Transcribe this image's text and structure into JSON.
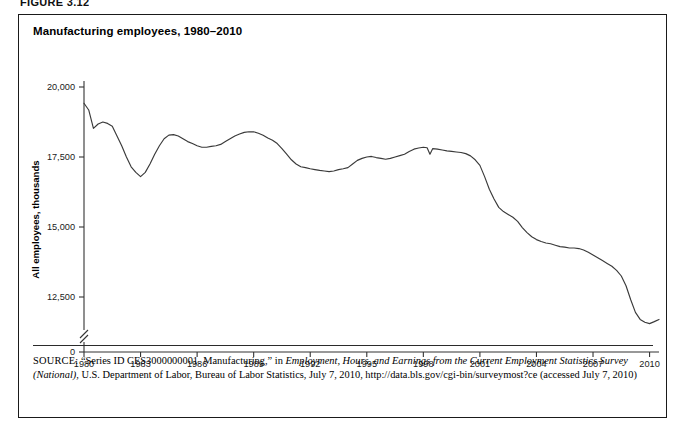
{
  "figure": {
    "number_label": "FIGURE 3.12",
    "title": "Manufacturing employees, 1980–2010"
  },
  "source": {
    "label": "SOURCE:",
    "text_before_italic": " “Series ID CES3000000001. Manufacturing,” in ",
    "italic_text": "Employment, Hours, and Earnings from the Current Employment Statistics Survey (National)",
    "text_after_italic": ", U.S. Department of Labor, Bureau of Labor Statistics, July 7, 2010, http://data.bls.gov/cgi-bin/surveymost?ce (accessed July 7, 2010)"
  },
  "chart_data": {
    "type": "line",
    "title": "Manufacturing employees, 1980–2010",
    "xlabel": "Month",
    "ylabel": "All employees, thousands",
    "xlim": [
      1980,
      2010.5
    ],
    "ylim": [
      11500,
      20000
    ],
    "yaxis_break": true,
    "yaxis_break_note": "axis broken between 0 and 12,500",
    "grid": false,
    "legend": "none",
    "xticks": [
      "1980",
      "1983",
      "1986",
      "1989",
      "1992",
      "1995",
      "1998",
      "2001",
      "2004",
      "2007",
      "2010"
    ],
    "xtick_values": [
      1980,
      1983,
      1986,
      1989,
      1992,
      1995,
      1998,
      2001,
      2004,
      2007,
      2010
    ],
    "yticks": [
      "0",
      "12,500",
      "15,000",
      "17,500",
      "20,000"
    ],
    "ytick_values": [
      0,
      12500,
      15000,
      17500,
      20000
    ],
    "series": [
      {
        "name": "All manufacturing employees (thousands)",
        "x": [
          1980.0,
          1980.25,
          1980.5,
          1980.75,
          1981.0,
          1981.25,
          1981.5,
          1981.75,
          1982.0,
          1982.25,
          1982.5,
          1982.75,
          1983.0,
          1983.25,
          1983.5,
          1983.75,
          1984.0,
          1984.25,
          1984.5,
          1984.75,
          1985.0,
          1985.25,
          1985.5,
          1985.75,
          1986.0,
          1986.25,
          1986.5,
          1986.75,
          1987.0,
          1987.25,
          1987.5,
          1987.75,
          1988.0,
          1988.25,
          1988.5,
          1988.75,
          1989.0,
          1989.25,
          1989.5,
          1989.75,
          1990.0,
          1990.25,
          1990.5,
          1990.75,
          1991.0,
          1991.25,
          1991.5,
          1991.75,
          1992.0,
          1992.25,
          1992.5,
          1992.75,
          1993.0,
          1993.25,
          1993.5,
          1993.75,
          1994.0,
          1994.25,
          1994.5,
          1994.75,
          1995.0,
          1995.25,
          1995.5,
          1995.75,
          1996.0,
          1996.25,
          1996.5,
          1996.75,
          1997.0,
          1997.25,
          1997.5,
          1997.75,
          1998.0,
          1998.2,
          1998.35,
          1998.5,
          1998.75,
          1999.0,
          1999.25,
          1999.5,
          1999.75,
          2000.0,
          2000.25,
          2000.5,
          2000.75,
          2001.0,
          2001.25,
          2001.5,
          2001.75,
          2002.0,
          2002.25,
          2002.5,
          2002.75,
          2003.0,
          2003.25,
          2003.5,
          2003.75,
          2004.0,
          2004.25,
          2004.5,
          2004.75,
          2005.0,
          2005.25,
          2005.5,
          2005.75,
          2006.0,
          2006.25,
          2006.5,
          2006.75,
          2007.0,
          2007.25,
          2007.5,
          2007.75,
          2008.0,
          2008.25,
          2008.5,
          2008.75,
          2009.0,
          2009.25,
          2009.5,
          2009.75,
          2010.0,
          2010.25,
          2010.5
        ],
        "y": [
          19420,
          19180,
          18520,
          18680,
          18750,
          18700,
          18600,
          18250,
          17900,
          17500,
          17150,
          16950,
          16800,
          16950,
          17250,
          17600,
          17900,
          18150,
          18280,
          18300,
          18250,
          18150,
          18050,
          17980,
          17900,
          17850,
          17850,
          17880,
          17900,
          17950,
          18050,
          18150,
          18250,
          18320,
          18380,
          18400,
          18400,
          18350,
          18280,
          18180,
          18100,
          17980,
          17800,
          17600,
          17400,
          17250,
          17150,
          17120,
          17080,
          17050,
          17020,
          17000,
          16980,
          17000,
          17050,
          17080,
          17120,
          17250,
          17380,
          17450,
          17500,
          17520,
          17480,
          17450,
          17420,
          17450,
          17500,
          17550,
          17600,
          17700,
          17780,
          17820,
          17850,
          17830,
          17600,
          17800,
          17780,
          17750,
          17720,
          17700,
          17680,
          17660,
          17620,
          17540,
          17400,
          17200,
          16800,
          16350,
          16000,
          15700,
          15550,
          15450,
          15350,
          15200,
          14980,
          14800,
          14650,
          14550,
          14480,
          14430,
          14400,
          14350,
          14300,
          14280,
          14250,
          14250,
          14230,
          14180,
          14100,
          14000,
          13900,
          13800,
          13700,
          13600,
          13450,
          13250,
          12900,
          12400,
          11950,
          11700,
          11600,
          11550,
          11620,
          11700
        ]
      }
    ]
  }
}
